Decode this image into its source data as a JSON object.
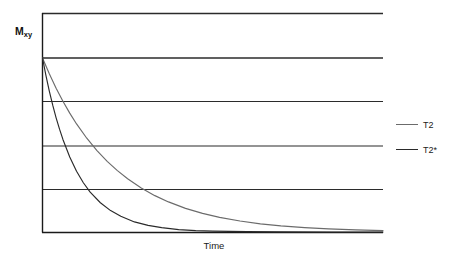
{
  "chart_data": {
    "type": "line",
    "title": "",
    "subtitle": "",
    "xlabel": "Time",
    "ylabel": "Mxy",
    "ylabel_base": "M",
    "ylabel_sub": "xy",
    "xlim": [
      0,
      1
    ],
    "ylim": [
      0,
      1.2
    ],
    "grid": true,
    "grid_orientation": "horizontal",
    "gridline_count": 6,
    "gridline_y_values": [
      1.2,
      1.0,
      0.8,
      0.6,
      0.4,
      0.0
    ],
    "axis_ticks_shown": false,
    "legend_position": "right",
    "series": [
      {
        "name": "T2",
        "color": "#6b6b6b",
        "decay_constant": 0.21,
        "initial_value": 1.0,
        "x": [
          0.0,
          0.02,
          0.04,
          0.06,
          0.08,
          0.1,
          0.13,
          0.16,
          0.19,
          0.22,
          0.25,
          0.29,
          0.33,
          0.37,
          0.42,
          0.47,
          0.52,
          0.58,
          0.64,
          0.7,
          0.77,
          0.84,
          0.92,
          1.0
        ],
        "y": [
          1.0,
          0.909,
          0.826,
          0.751,
          0.683,
          0.621,
          0.539,
          0.468,
          0.406,
          0.353,
          0.306,
          0.253,
          0.209,
          0.173,
          0.136,
          0.107,
          0.084,
          0.063,
          0.047,
          0.035,
          0.025,
          0.018,
          0.012,
          0.008
        ]
      },
      {
        "name": "T2*",
        "color": "#2a2a2a",
        "decay_constant": 0.095,
        "initial_value": 1.0,
        "x": [
          0.0,
          0.01,
          0.02,
          0.03,
          0.04,
          0.05,
          0.06,
          0.08,
          0.1,
          0.12,
          0.14,
          0.17,
          0.2,
          0.23,
          0.27,
          0.31,
          0.35,
          0.4,
          0.45,
          0.5,
          0.6,
          0.7,
          0.85,
          1.0
        ],
        "y": [
          1.0,
          0.9,
          0.81,
          0.729,
          0.656,
          0.591,
          0.532,
          0.431,
          0.349,
          0.283,
          0.229,
          0.168,
          0.123,
          0.09,
          0.058,
          0.038,
          0.025,
          0.014,
          0.008,
          0.005,
          0.002,
          0.001,
          0.0,
          0.0
        ]
      }
    ],
    "legend_entries": [
      {
        "label": "T2",
        "color": "#6b6b6b"
      },
      {
        "label": "T2*",
        "color": "#2a2a2a"
      }
    ],
    "annotations": []
  },
  "legend": {
    "items": [
      {
        "label": "T2"
      },
      {
        "label": "T2*"
      }
    ]
  },
  "axes": {
    "x_title": "Time",
    "y_title_base": "M",
    "y_title_sub": "xy"
  },
  "colors": {
    "t2_line": "#6b6b6b",
    "t2star_line": "#2a2a2a",
    "gridline": "#2b2b2b",
    "axis": "#1a1a1a",
    "background": "#ffffff"
  }
}
